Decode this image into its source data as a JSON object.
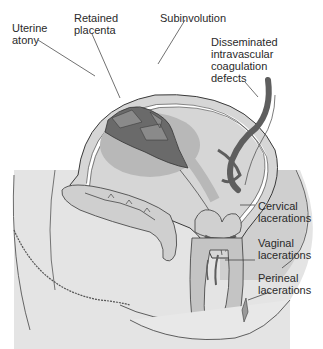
{
  "diagram": {
    "labels": {
      "uterine_atony": "Uterine\natony",
      "retained_placenta": "Retained\nplacenta",
      "subinvolution": "Subinvolution",
      "dic": "Disseminated\nintravascular\ncoagulation\ndefects",
      "cervical": "Cervical\nlacerations",
      "vaginal": "Vaginal\nlacerations",
      "perineal": "Perineal\nlacerations"
    },
    "colors": {
      "background": "#ffffff",
      "body_fill": "#c9c9c9",
      "uterus_fill": "#d8d8d8",
      "placenta_halo": "#b4b4b4",
      "placenta_dark": "#6a6a6a",
      "vessel_dark": "#5e5e5e",
      "outline": "#3a3a3a",
      "text": "#2a2a2a"
    }
  }
}
